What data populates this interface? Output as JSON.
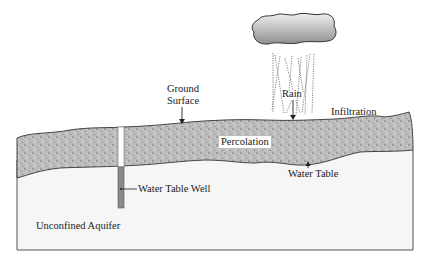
{
  "diagram": {
    "labels": {
      "ground_surface_line1": "Ground",
      "ground_surface_line2": "Surface",
      "rain": "Rain",
      "infiltration": "Infiltration",
      "percolation": "Percolation",
      "water_table": "Water Table",
      "water_table_well": "Water Table Well",
      "unconfined_aquifer": "Unconfined Aquifer"
    },
    "icons": {
      "cloud": "cloud-icon",
      "rain": "rain-streaks-icon"
    },
    "colors": {
      "soil": "#b9b9b9",
      "soil_speckle": "#6e6e6e",
      "aquifer": "#f6f6f6",
      "well_casing": "#ffffff",
      "well_screen": "#8a8a8a",
      "cloud_light": "#e8e8e8",
      "cloud_dark": "#9a9a9a",
      "outline": "#444444"
    }
  }
}
